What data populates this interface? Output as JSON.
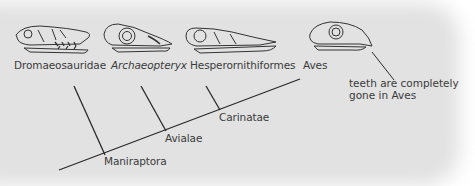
{
  "taxa": [
    {
      "name": "Dromaeosauridae",
      "italic": false
    },
    {
      "name": "Archaeopteryx",
      "italic": true
    },
    {
      "name": "Hesperornithiformes",
      "italic": false
    },
    {
      "name": "Aves",
      "italic": false
    }
  ],
  "clades": [
    {
      "name": "Maniraptora"
    },
    {
      "name": "Avialae"
    },
    {
      "name": "Carinatae"
    }
  ],
  "annotation": {
    "line1": "teeth are completely",
    "line2": "gone in Aves"
  },
  "colors": {
    "background": "#e2e2e2",
    "line": "#2a2a2a",
    "text": "#3a3a3a"
  }
}
